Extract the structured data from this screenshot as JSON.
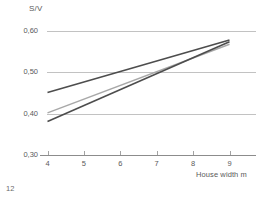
{
  "chart_data": {
    "type": "line",
    "title": "",
    "xlabel": "House width m",
    "ylabel": "S/V",
    "xlim": [
      3.6,
      9.6
    ],
    "ylim": [
      0.3,
      0.61
    ],
    "grid": true,
    "legend": "none",
    "x_ticks": [
      "4",
      "5",
      "6",
      "7",
      "8",
      "9"
    ],
    "x_tick_values": [
      4,
      5,
      6,
      7,
      8,
      9
    ],
    "y_ticks": [
      "0,30",
      "0,40",
      "0,50",
      "0,60"
    ],
    "y_tick_values": [
      0.3,
      0.4,
      0.5,
      0.6
    ],
    "series": [
      {
        "name": "series-1",
        "color": "#4d4d4d",
        "width": 1.6,
        "x": [
          4,
          9
        ],
        "values": [
          0.451,
          0.578
        ]
      },
      {
        "name": "series-2",
        "color": "#a8a8a8",
        "width": 1.4,
        "x": [
          4,
          9
        ],
        "values": [
          0.402,
          0.568
        ]
      },
      {
        "name": "series-3",
        "color": "#4d4d4d",
        "width": 1.6,
        "x": [
          4,
          9
        ],
        "values": [
          0.381,
          0.574
        ]
      }
    ]
  },
  "axis": {
    "y_title": "S/V",
    "x_title": "House width m"
  },
  "footer": {
    "page_number": "12"
  },
  "colors": {
    "gridline": "#b3b3b3",
    "axis": "#8c8c8c",
    "text": "#5a5a5a",
    "dark_series": "#4d4d4d",
    "light_series": "#a8a8a8"
  }
}
